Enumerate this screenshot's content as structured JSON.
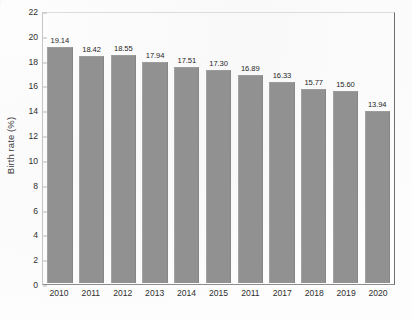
{
  "chart_data": {
    "type": "bar",
    "title": "",
    "xlabel": "",
    "ylabel": "Birth rate (%)",
    "categories": [
      "2010",
      "2011",
      "2012",
      "2013",
      "2014",
      "2015",
      "2011",
      "2017",
      "2018",
      "2019",
      "2020"
    ],
    "values": [
      19.14,
      18.42,
      18.55,
      17.94,
      17.51,
      17.3,
      16.89,
      16.33,
      15.77,
      15.6,
      13.94
    ],
    "value_labels": [
      "19.14",
      "18.42",
      "18.55",
      "17.94",
      "17.51",
      "17.30",
      "16.89",
      "16.33",
      "15.77",
      "15.60",
      "13.94"
    ],
    "ylim": [
      0,
      22
    ],
    "ytick_step": 2,
    "yticks": [
      "22",
      "20",
      "18",
      "16",
      "14",
      "12",
      "10",
      "8",
      "6",
      "4",
      "2",
      "0"
    ],
    "grid": false,
    "legend": null,
    "bar_color": "#919191",
    "axis_color": "#6f6f6f",
    "text_color": "#2f2f2f",
    "background": "#fdfdfd"
  }
}
